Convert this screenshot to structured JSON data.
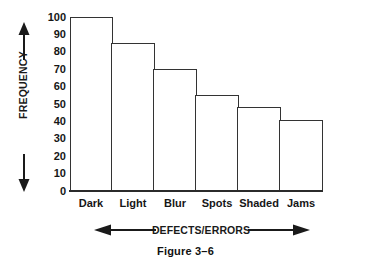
{
  "chart_data": {
    "type": "bar",
    "title": "",
    "subtitle": "",
    "categories": [
      "Dark",
      "Light",
      "Blur",
      "Spots",
      "Shaded",
      "Jams"
    ],
    "values": [
      100,
      85,
      70,
      55,
      48,
      41
    ],
    "series": [
      {
        "name": "Frequency",
        "values": [
          100,
          85,
          70,
          55,
          48,
          41
        ]
      }
    ],
    "xlabel": "DEFECTS/ERRORS",
    "ylabel": "FREQUENCY",
    "ylim": [
      0,
      100
    ],
    "ytick_labels": [
      "100",
      "90",
      "80",
      "70",
      "60",
      "50",
      "40",
      "30",
      "20",
      "10",
      "0"
    ],
    "ytick_values": [
      100,
      90,
      80,
      70,
      60,
      50,
      40,
      30,
      20,
      10,
      0
    ],
    "grid": false,
    "legend": false,
    "legend_position": "none",
    "bar_fill_color": "#ffffff",
    "bar_edge_color": "#333333",
    "axis_color": "#2b2b2b",
    "text_color": "#161616",
    "background_color": "#ffffff",
    "annotations": {
      "y_arrow_up": "arrow-up-icon",
      "y_arrow_down": "arrow-down-icon",
      "x_arrow_left": "arrow-left-icon",
      "x_arrow_right": "arrow-right-icon"
    }
  },
  "caption": {
    "text": "Figure 3–6"
  }
}
